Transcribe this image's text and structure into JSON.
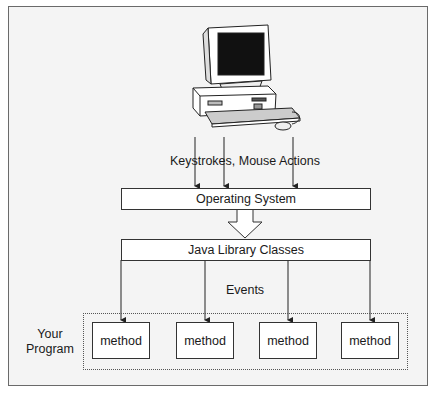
{
  "diagram": {
    "computer_icon": "desktop-computer-icon",
    "input_label": "Keystrokes, Mouse Actions",
    "os_box": "Operating System",
    "library_box": "Java Library Classes",
    "events_label": "Events",
    "program_label_line1": "Your",
    "program_label_line2": "Program",
    "methods": [
      "method",
      "method",
      "method",
      "method"
    ]
  },
  "colors": {
    "background": "#f4f4f4",
    "box_fill": "#ffffff",
    "stroke": "#333333"
  }
}
